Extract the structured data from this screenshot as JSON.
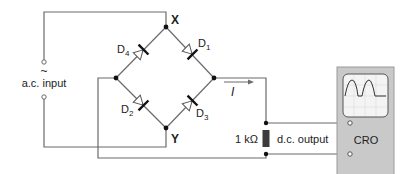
{
  "nodes": {
    "top": "X",
    "bottom": "Y"
  },
  "diodes": [
    {
      "label": "D",
      "sub": "4"
    },
    {
      "label": "D",
      "sub": "1"
    },
    {
      "label": "D",
      "sub": "2"
    },
    {
      "label": "D",
      "sub": "3"
    }
  ],
  "input": {
    "symbol": "~",
    "label": "a.c. input"
  },
  "current": {
    "label": "I"
  },
  "resistor": {
    "label": "1 kΩ"
  },
  "output": {
    "label": "d.c. output"
  },
  "cro": {
    "label": "CRO"
  },
  "colors": {
    "wire": "#6b6b6b",
    "cro_body": "#c9c9c9",
    "screen": "#f4f4f4",
    "resistor": "#3c3c3c"
  }
}
